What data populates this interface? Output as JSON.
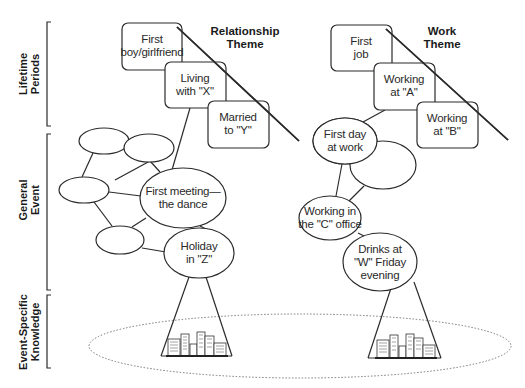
{
  "levels": [
    {
      "id": "lifetime",
      "line1": "Lifetime",
      "line2": "Periods"
    },
    {
      "id": "general",
      "line1": "General",
      "line2": "Event"
    },
    {
      "id": "esk",
      "line1": "Event-Specific",
      "line2": "Knowledge"
    }
  ],
  "themes": {
    "relationship": {
      "title_line1": "Relationship",
      "title_line2": "Theme",
      "periods": [
        {
          "line1": "First",
          "line2": "boy/girlfriend"
        },
        {
          "line1": "Living",
          "line2": "with \"X\""
        },
        {
          "line1": "Married",
          "line2": "to \"Y\""
        }
      ],
      "events": [
        {
          "line1": "First meeting—",
          "line2": "the dance"
        },
        {
          "line1": "Holiday",
          "line2": "in \"Z\""
        }
      ]
    },
    "work": {
      "title_line1": "Work",
      "title_line2": "Theme",
      "periods": [
        {
          "line1": "First",
          "line2": "job"
        },
        {
          "line1": "Working",
          "line2": "at \"A\""
        },
        {
          "line1": "Working",
          "line2": "at \"B\""
        }
      ],
      "events": [
        {
          "line1": "First day",
          "line2": "at work"
        },
        {
          "line1": "Working in",
          "line2": "the \"C\" office"
        },
        {
          "line1": "Drinks at",
          "line2": "\"W\" Friday",
          "line3": "evening"
        }
      ]
    }
  },
  "colors": {
    "stroke": "#2b2b2b",
    "dotted": "#777777",
    "background": "#ffffff"
  }
}
